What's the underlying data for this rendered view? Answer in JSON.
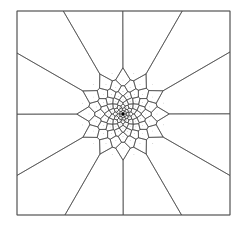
{
  "diagram": {
    "type": "voronoi-tessellation",
    "frame": {
      "x0": 17,
      "y0": 11,
      "x1": 230,
      "y1": 215
    },
    "center": {
      "x": 123,
      "y": 114
    },
    "colors": {
      "edge": "#3a3a3a",
      "frame": "#555555",
      "site": "#888888",
      "center": "#000000",
      "background": "#ffffff"
    },
    "rings": [
      {
        "count": 1,
        "radius": 0,
        "phase": 0
      },
      {
        "count": 6,
        "radius": 2.2,
        "phase": 0
      },
      {
        "count": 9,
        "radius": 4.6,
        "phase": 0.2
      },
      {
        "count": 12,
        "radius": 7.4,
        "phase": 0.0
      },
      {
        "count": 12,
        "radius": 10.6,
        "phase": 0.26
      },
      {
        "count": 12,
        "radius": 14.2,
        "phase": 0.0
      },
      {
        "count": 12,
        "radius": 18.2,
        "phase": 0.26
      },
      {
        "count": 12,
        "radius": 22.6,
        "phase": 0.0
      },
      {
        "count": 12,
        "radius": 27.6,
        "phase": 0.26
      },
      {
        "count": 12,
        "radius": 34.0,
        "phase": 0.0
      },
      {
        "count": 12,
        "radius": 42.0,
        "phase": 0.26
      }
    ],
    "spokes": 12
  }
}
